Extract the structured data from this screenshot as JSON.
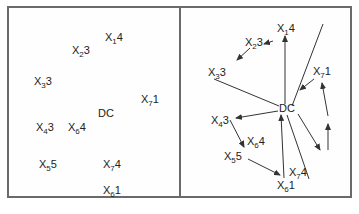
{
  "left_panel": {
    "nodes": [
      {
        "id": "X1",
        "sub": "1",
        "weight": "4",
        "x": 105,
        "y": 37
      },
      {
        "id": "X2",
        "sub": "2",
        "weight": "3",
        "x": 72,
        "y": 50
      },
      {
        "id": "X3",
        "sub": "3",
        "weight": "3",
        "x": 34,
        "y": 81
      },
      {
        "id": "X7a",
        "sub": "7",
        "weight": "1",
        "x": 141,
        "y": 103
      },
      {
        "id": "DC",
        "label": "DC",
        "x": 98,
        "y": 117
      },
      {
        "id": "X4",
        "sub": "4",
        "weight": "3",
        "x": 36,
        "y": 131
      },
      {
        "id": "X6a",
        "sub": "6",
        "weight": "4",
        "x": 68,
        "y": 131
      },
      {
        "id": "X5",
        "sub": "5",
        "weight": "5",
        "x": 39,
        "y": 168
      },
      {
        "id": "X7b",
        "sub": "7",
        "weight": "4",
        "x": 103,
        "y": 168
      },
      {
        "id": "X6b",
        "sub": "6",
        "weight": "1",
        "x": 103,
        "y": 195
      }
    ]
  },
  "right_panel": {
    "nodes": [
      {
        "id": "X1",
        "sub": "1",
        "weight": "4",
        "x": 277,
        "y": 31
      },
      {
        "id": "X2",
        "sub": "2",
        "weight": "3",
        "x": 245,
        "y": 44
      },
      {
        "id": "X3",
        "sub": "3",
        "weight": "3",
        "x": 208,
        "y": 75
      },
      {
        "id": "X7a",
        "sub": "7",
        "weight": "1",
        "x": 313,
        "y": 74
      },
      {
        "id": "DC",
        "label": "DC",
        "x": 279,
        "y": 110
      },
      {
        "id": "X4",
        "sub": "4",
        "weight": "3",
        "x": 211,
        "y": 124
      },
      {
        "id": "X6a",
        "sub": "6",
        "weight": "4",
        "x": 247,
        "y": 144
      },
      {
        "id": "X5",
        "sub": "5",
        "weight": "5",
        "x": 224,
        "y": 160
      },
      {
        "id": "X7b",
        "sub": "7",
        "weight": "4",
        "x": 288,
        "y": 176
      },
      {
        "id": "X6b",
        "sub": "6",
        "weight": "1",
        "x": 277,
        "y": 189
      }
    ]
  }
}
